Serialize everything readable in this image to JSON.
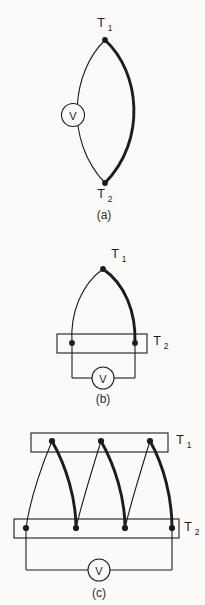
{
  "page": {
    "background_color": "#fbfaf8",
    "ink_color": "#1c1c1c",
    "width": 205,
    "height": 605
  },
  "figures": [
    {
      "id": "fig-a",
      "caption": "(a)",
      "type": "single-thermocouple-lens",
      "labels": {
        "hot_junction": "T1",
        "hot_junction_display": "T",
        "hot_junction_sub": "1",
        "cold_junction": "T2",
        "cold_junction_display": "T",
        "cold_junction_sub": "2"
      },
      "meter": {
        "name": "voltmeter",
        "symbol": "V"
      },
      "junction_dots": 2,
      "wires": [
        {
          "name": "left-wire",
          "style": "thin"
        },
        {
          "name": "right-wire",
          "style": "thick"
        }
      ]
    },
    {
      "id": "fig-b",
      "caption": "(b)",
      "type": "thermocouple-with-cold-block",
      "labels": {
        "hot_junction": "T1",
        "hot_junction_display": "T",
        "hot_junction_sub": "1",
        "cold_block": "T2",
        "cold_block_display": "T",
        "cold_block_sub": "2"
      },
      "meter": {
        "name": "voltmeter",
        "symbol": "V"
      },
      "junction_dots": 3,
      "wires": [
        {
          "name": "left-wire",
          "style": "thin"
        },
        {
          "name": "right-wire",
          "style": "thick"
        }
      ]
    },
    {
      "id": "fig-c",
      "caption": "(c)",
      "type": "thermopile-series",
      "labels": {
        "hot_bar": "T1",
        "hot_bar_display": "T",
        "hot_bar_sub": "1",
        "cold_bar": "T2",
        "cold_bar_display": "T",
        "cold_bar_sub": "2"
      },
      "meter": {
        "name": "voltmeter",
        "symbol": "V"
      },
      "hot_junction_count": 3,
      "cold_junction_count": 4,
      "wires": [
        {
          "name": "thin-wires",
          "style": "thin",
          "count": 3
        },
        {
          "name": "thick-wires",
          "style": "thick",
          "count": 3
        }
      ]
    }
  ]
}
